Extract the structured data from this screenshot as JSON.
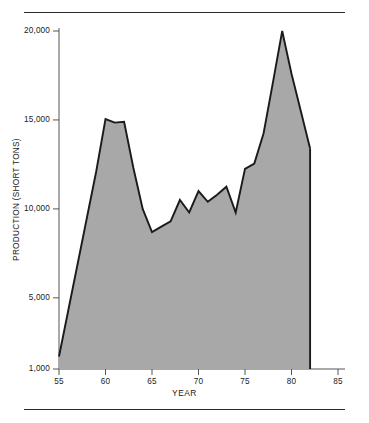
{
  "figure": {
    "background_color": "#ffffff",
    "rule_color": "#2b2b2b",
    "top_rule_label": "top-rule",
    "bottom_rule_label": "bottom-rule"
  },
  "axis": {
    "y_title": "PRODUCTION (SHORT TONS)",
    "x_title": "YEAR",
    "y_ticks": [
      "1,000",
      "5,000",
      "10,000",
      "15,000",
      "20,000"
    ],
    "x_ticks": [
      "55",
      "60",
      "65",
      "70",
      "75",
      "80",
      "85"
    ]
  },
  "chart_data": {
    "type": "area",
    "title": "",
    "subtitle": "",
    "xlabel": "YEAR",
    "ylabel": "PRODUCTION (SHORT TONS)",
    "xlim": [
      55,
      85
    ],
    "ylim": [
      1000,
      20000
    ],
    "xtick_values": [
      55,
      60,
      65,
      70,
      75,
      80,
      85
    ],
    "ytick_values": [
      1000,
      5000,
      10000,
      15000,
      20000
    ],
    "ytick_labels": [
      "1,000",
      "5,000",
      "10,000",
      "15,000",
      "20,000"
    ],
    "xtick_labels": [
      "55",
      "60",
      "65",
      "70",
      "75",
      "80",
      "85"
    ],
    "grid": false,
    "legend": false,
    "fill_color": "#a8a8a8",
    "line_color": "#1a1a1a",
    "baseline": 1000,
    "x": [
      55,
      56,
      57,
      58,
      59,
      60,
      61,
      62,
      63,
      64,
      65,
      66,
      67,
      68,
      69,
      70,
      71,
      72,
      73,
      74,
      75,
      76,
      77,
      78,
      79,
      80,
      81,
      82
    ],
    "values": [
      1700,
      4300,
      6900,
      9500,
      12100,
      15050,
      14850,
      14900,
      12300,
      10000,
      8700,
      9000,
      9300,
      10500,
      9800,
      11000,
      10400,
      10800,
      11250,
      9800,
      12250,
      12550,
      14250,
      17100,
      20000,
      17600,
      15500,
      13400
    ],
    "series": [
      {
        "name": "Production",
        "values": [
          1700,
          4300,
          6900,
          9500,
          12100,
          15050,
          14850,
          14900,
          12300,
          10000,
          8700,
          9000,
          9300,
          10500,
          9800,
          11000,
          10400,
          10800,
          11250,
          9800,
          12250,
          12550,
          14250,
          17100,
          20000,
          17600,
          15500,
          13400
        ]
      }
    ],
    "annotations": []
  }
}
